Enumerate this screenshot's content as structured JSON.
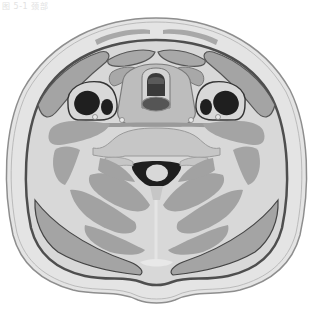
{
  "caption": "图 5-1 颈部",
  "diagram": {
    "colors": {
      "background": "#ffffff",
      "skin_outline": "#9a9a9a",
      "subcutaneous": "#e3e3e3",
      "fascia": "#5a5a5a",
      "muscle": "#a4a4a4",
      "muscle_light": "#bdbdbd",
      "connective": "#d6d6d6",
      "vessel": "#1e1e1e",
      "airway": "#3a3a3a",
      "cord": "#d8d8d8",
      "bone": "#c9c9c9"
    },
    "structures": [
      {
        "id": "skin",
        "label": "Skin"
      },
      {
        "id": "platysma",
        "label": "Platysma"
      },
      {
        "id": "sternocleidomastoid-left",
        "label": "Sternocleidomastoid (left)"
      },
      {
        "id": "sternocleidomastoid-right",
        "label": "Sternocleidomastoid (right)"
      },
      {
        "id": "infrahyoid-muscles",
        "label": "Infrahyoid muscles"
      },
      {
        "id": "thyroid-larynx",
        "label": "Larynx / thyroid region"
      },
      {
        "id": "airway",
        "label": "Airway"
      },
      {
        "id": "esophagus",
        "label": "Esophagus"
      },
      {
        "id": "carotid-sheath-left",
        "label": "Carotid sheath (left)"
      },
      {
        "id": "carotid-sheath-right",
        "label": "Carotid sheath (right)"
      },
      {
        "id": "internal-jugular-left",
        "label": "Internal jugular vein (left)"
      },
      {
        "id": "common-carotid-left",
        "label": "Common carotid artery (left)"
      },
      {
        "id": "internal-jugular-right",
        "label": "Internal jugular vein (right)"
      },
      {
        "id": "common-carotid-right",
        "label": "Common carotid artery (right)"
      },
      {
        "id": "vertebra",
        "label": "Cervical vertebra"
      },
      {
        "id": "spinal-canal",
        "label": "Spinal canal"
      },
      {
        "id": "spinal-cord",
        "label": "Spinal cord"
      },
      {
        "id": "deep-back-muscles",
        "label": "Deep back muscles"
      },
      {
        "id": "trapezius-left",
        "label": "Trapezius (left)"
      },
      {
        "id": "trapezius-right",
        "label": "Trapezius (right)"
      },
      {
        "id": "nuchal-ligament",
        "label": "Nuchal ligament"
      }
    ]
  }
}
